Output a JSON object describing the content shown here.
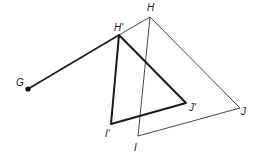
{
  "diagram": {
    "center": {
      "label": "G"
    },
    "original_triangle": {
      "vertices": [
        {
          "id": "H",
          "label": "H"
        },
        {
          "id": "I",
          "label": "I"
        },
        {
          "id": "J",
          "label": "J"
        }
      ]
    },
    "image_triangle": {
      "vertices": [
        {
          "id": "H'",
          "label": "H'"
        },
        {
          "id": "I'",
          "label": "I'"
        },
        {
          "id": "J'",
          "label": "J'"
        }
      ]
    },
    "segments": [
      {
        "from": "G",
        "to": "H'",
        "style": "bold"
      },
      {
        "from": "H'",
        "to": "H",
        "style": "thin"
      }
    ],
    "colors": {
      "ink": "#1a1a1a",
      "background": "#ffffff"
    }
  }
}
